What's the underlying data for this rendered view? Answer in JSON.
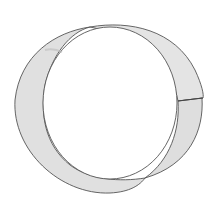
{
  "image": {
    "subject": "pencil drawing of a twisted paper band (ring)",
    "colors": {
      "background": "#ffffff",
      "band_fill": "#e2e2e2",
      "band_shade": "#d4d4d4",
      "outline": "#555555"
    }
  }
}
